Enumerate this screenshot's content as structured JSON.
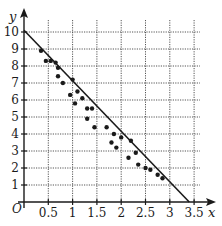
{
  "chart_data": {
    "type": "scatter",
    "title": "",
    "xlabel": "x",
    "ylabel": "y",
    "origin_label": "O",
    "xlim": [
      0,
      3.6
    ],
    "ylim": [
      0,
      10.5
    ],
    "x_ticks": [
      0.5,
      1,
      1.5,
      2,
      2.5,
      3,
      3.5
    ],
    "x_tick_labels": [
      "0.5",
      "1",
      "1.5",
      "2",
      "2.5",
      "3",
      "3.5"
    ],
    "y_ticks": [
      1,
      2,
      3,
      4,
      5,
      6,
      7,
      8,
      9,
      10
    ],
    "y_tick_labels": [
      "1",
      "2",
      "3",
      "4",
      "5",
      "6",
      "7",
      "8",
      "9",
      "10"
    ],
    "grid": true,
    "grid_style": "dotted",
    "legend": null,
    "points": [
      [
        0.35,
        8.9
      ],
      [
        0.45,
        8.3
      ],
      [
        0.55,
        8.3
      ],
      [
        0.65,
        8.2
      ],
      [
        0.7,
        7.9
      ],
      [
        0.7,
        7.4
      ],
      [
        0.8,
        7.0
      ],
      [
        1.0,
        7.2
      ],
      [
        0.95,
        6.3
      ],
      [
        1.1,
        6.5
      ],
      [
        1.05,
        5.8
      ],
      [
        1.2,
        6.1
      ],
      [
        1.3,
        5.5
      ],
      [
        1.3,
        4.9
      ],
      [
        1.4,
        5.5
      ],
      [
        1.45,
        4.4
      ],
      [
        1.7,
        4.4
      ],
      [
        1.85,
        4.0
      ],
      [
        1.8,
        3.5
      ],
      [
        1.9,
        3.2
      ],
      [
        2.0,
        3.8
      ],
      [
        2.2,
        3.6
      ],
      [
        2.15,
        2.6
      ],
      [
        2.3,
        2.9
      ],
      [
        2.35,
        2.2
      ],
      [
        2.5,
        2.0
      ],
      [
        2.6,
        1.9
      ],
      [
        2.75,
        1.6
      ],
      [
        2.85,
        1.4
      ]
    ],
    "regression_line": {
      "x": [
        0,
        3.4
      ],
      "y": [
        10.1,
        0
      ]
    },
    "colors": {
      "points": "#1a1a1a",
      "line": "#1a1a1a",
      "grid": "#555555",
      "axes": "#1a1a1a"
    }
  }
}
